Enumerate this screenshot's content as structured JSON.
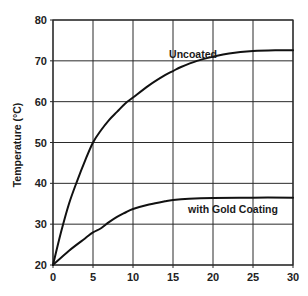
{
  "chart_data": {
    "type": "line",
    "title": "",
    "xlabel": "",
    "ylabel": "Temperature (°C)",
    "xlim": [
      0,
      30
    ],
    "ylim": [
      20,
      80
    ],
    "x_ticks": [
      0,
      5,
      10,
      15,
      20,
      25,
      30
    ],
    "y_ticks": [
      20,
      30,
      40,
      50,
      60,
      70,
      80
    ],
    "grid": true,
    "legend": "none (inline annotations)",
    "series": [
      {
        "name": "Uncoated",
        "x": [
          0,
          1,
          2,
          3,
          4,
          5,
          6,
          7,
          8,
          9,
          10,
          12,
          14,
          15,
          16,
          18,
          20,
          22,
          25,
          28,
          30
        ],
        "values": [
          20,
          28,
          35,
          40.5,
          45.5,
          50,
          53,
          55.5,
          57.5,
          59.5,
          61,
          64,
          66.5,
          67.5,
          68.5,
          70,
          71,
          71.8,
          72.4,
          72.6,
          72.6
        ]
      },
      {
        "name": "with Gold Coating",
        "x": [
          0,
          2,
          4,
          5,
          6,
          7,
          8,
          9,
          10,
          12,
          14,
          15,
          17,
          20,
          25,
          30
        ],
        "values": [
          20,
          23.5,
          26.5,
          28,
          29,
          30.5,
          31.8,
          32.8,
          33.7,
          34.8,
          35.6,
          35.9,
          36.2,
          36.4,
          36.5,
          36.5
        ]
      }
    ],
    "annotations": [
      {
        "text": "Uncoated",
        "x": 17.5,
        "y": 71.5
      },
      {
        "text": "with Gold Coating",
        "x": 22.5,
        "y": 33.5
      }
    ]
  }
}
